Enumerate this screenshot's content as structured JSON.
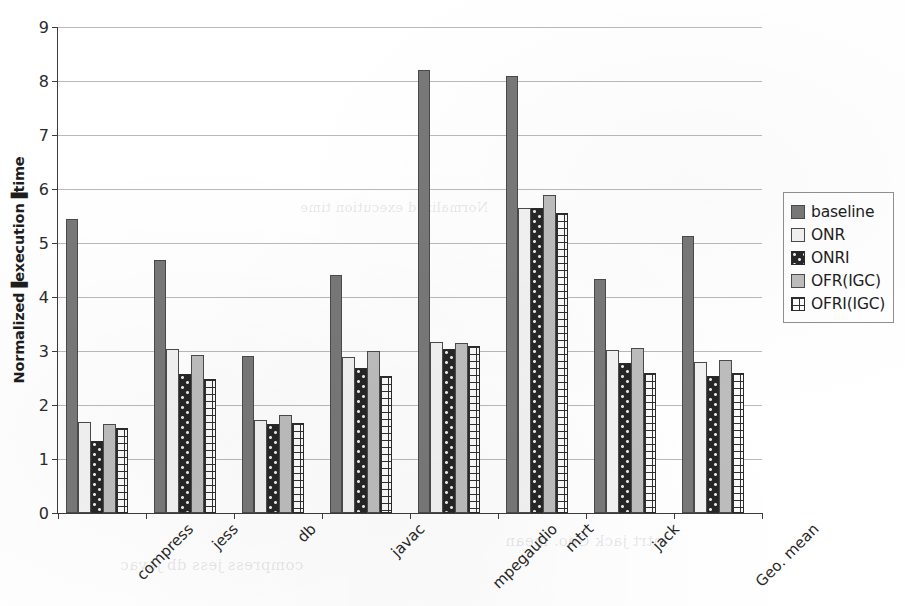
{
  "chart_data": {
    "type": "bar",
    "title": "",
    "xlabel": "",
    "ylabel": "Normalized▐execution▐time",
    "ylim": [
      0,
      9
    ],
    "ytick_step": 1,
    "ytick_labels": [
      "0",
      "1",
      "2",
      "3",
      "4",
      "5",
      "6",
      "7",
      "8",
      "9"
    ],
    "grid": true,
    "legend_position": "right",
    "categories": [
      "compress",
      "jess",
      "db",
      "javac",
      "mpegaudio",
      "mtrt",
      "jack",
      "Geo. mean"
    ],
    "series": [
      {
        "name": "baseline",
        "color": "#787878",
        "pattern": "solid-dark-gray",
        "values": [
          5.45,
          4.68,
          2.9,
          4.4,
          8.2,
          8.1,
          4.33,
          5.13
        ]
      },
      {
        "name": "ONR",
        "color": "#f2f2f2",
        "pattern": "solid-white",
        "values": [
          1.68,
          3.03,
          1.72,
          2.88,
          3.17,
          5.64,
          3.01,
          2.8
        ]
      },
      {
        "name": "ONRI",
        "color": "#262626",
        "pattern": "dark-dotted",
        "values": [
          1.33,
          2.58,
          1.64,
          2.68,
          3.04,
          5.65,
          2.77,
          2.53
        ]
      },
      {
        "name": "OFR(IGC)",
        "color": "#bdbdbd",
        "pattern": "solid-light-gray",
        "values": [
          1.65,
          2.93,
          1.81,
          3.0,
          3.14,
          5.88,
          3.06,
          2.83
        ]
      },
      {
        "name": "OFRI(IGC)",
        "color": "#fbfbfb",
        "pattern": "white-grid",
        "values": [
          1.57,
          2.48,
          1.67,
          2.53,
          3.1,
          5.55,
          2.6,
          2.6
        ]
      }
    ]
  },
  "legend": {
    "items": [
      {
        "label": "baseline"
      },
      {
        "label": "ONR"
      },
      {
        "label": "ONRI"
      },
      {
        "label": "OFR(IGC)"
      },
      {
        "label": "OFRI(IGC)"
      }
    ]
  },
  "scan_artifacts": {
    "bleed_1": "mtrt   jack   Geo. mean",
    "bleed_2": "compress   jess   db   javac",
    "bleed_3": "Normalized execution time"
  }
}
